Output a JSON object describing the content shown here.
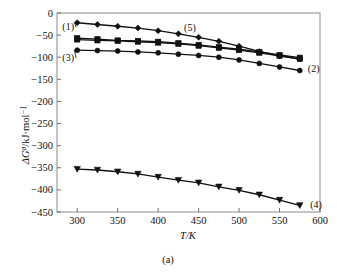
{
  "figure": {
    "caption": "(a)",
    "background": "#ffffff",
    "ink_color": "#111111",
    "frame_color": "#8a8a8a"
  },
  "chart_data": {
    "type": "line",
    "title": "",
    "xlabel": "T/K",
    "ylabel_parts": {
      "delta": "Δ",
      "g": "G",
      "superscript": "ø",
      "rest": "/kJ·mol",
      "exponent": "−1"
    },
    "ylabel": "ΔGø/kJ·mol⁻¹",
    "xlim": [
      275,
      600
    ],
    "ylim": [
      -450,
      0
    ],
    "xticks": [
      300,
      350,
      400,
      450,
      500,
      550,
      600
    ],
    "xticklabels": [
      "300",
      "350",
      "400",
      "450",
      "500",
      "550",
      "600"
    ],
    "yticks": [
      0,
      -50,
      -100,
      -150,
      -200,
      -250,
      -300,
      -350,
      -400,
      -450
    ],
    "yticklabels": [
      "0",
      "−50",
      "−100",
      "−150",
      "−200",
      "−250",
      "−300",
      "−350",
      "−400",
      "−450"
    ],
    "grid": false,
    "legend": "inline-curve-labels",
    "x": [
      300,
      325,
      350,
      375,
      400,
      425,
      450,
      475,
      500,
      525,
      550,
      575
    ],
    "series": [
      {
        "name": "(1)",
        "label": "(1)",
        "marker": "diamond",
        "label_x": 296,
        "label_y": -30,
        "values": [
          -22,
          -26,
          -30,
          -34,
          -40,
          -47,
          -55,
          -64,
          -75,
          -87,
          -97,
          -104
        ]
      },
      {
        "name": "(5)",
        "label": "(5)",
        "marker": "square",
        "label_x": 432,
        "label_y": -33,
        "values": [
          -57,
          -59,
          -62,
          -63,
          -65,
          -68,
          -72,
          -77,
          -82,
          -88,
          -95,
          -101
        ]
      },
      {
        "name": "(2)",
        "label": "(2)",
        "marker": "square",
        "label_x": 585,
        "label_y": -125,
        "values": [
          -60,
          -62,
          -63,
          -65,
          -67,
          -70,
          -74,
          -79,
          -84,
          -90,
          -97,
          -104
        ]
      },
      {
        "name": "(3)",
        "label": "(3)",
        "marker": "circle",
        "label_x": 296,
        "label_y": -100,
        "values": [
          -84,
          -85,
          -86,
          -88,
          -90,
          -93,
          -96,
          -100,
          -106,
          -114,
          -122,
          -130
        ]
      },
      {
        "name": "(4)",
        "label": "(4)",
        "marker": "triangle-down",
        "label_x": 588,
        "label_y": -434,
        "values": [
          -353,
          -355,
          -359,
          -364,
          -371,
          -378,
          -384,
          -393,
          -401,
          -411,
          -423,
          -435
        ]
      }
    ],
    "annotations": [
      {
        "text": "(1)",
        "target_series": "(1)",
        "note": "leader line to first point of series 1"
      },
      {
        "text": "(3)",
        "target_series": "(3)",
        "note": "leader line to first point of series 3"
      },
      {
        "text": "(5)",
        "target_series": "(5)",
        "note": "label above upper curves near 430 K"
      },
      {
        "text": "(2)",
        "target_series": "(2)",
        "note": "label at right end of lower upper-group curve"
      },
      {
        "text": "(4)",
        "target_series": "(4)",
        "note": "label at right end of bottom curve"
      }
    ]
  }
}
